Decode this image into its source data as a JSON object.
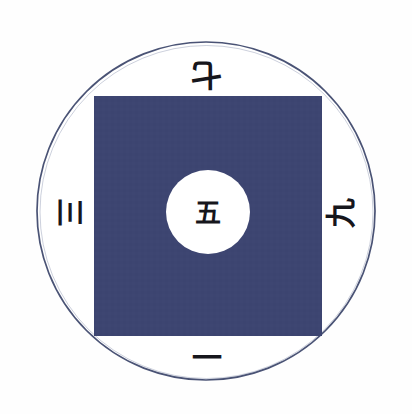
{
  "figure": {
    "background_color": "#fefefe"
  },
  "shapes": {
    "outer_circle": {
      "name": "outer-circle",
      "cx": 206,
      "cy": 211,
      "r": 169,
      "fill": "#ffffff",
      "stroke": "#4a5375",
      "stroke_width": 1.6
    },
    "square": {
      "name": "navy-square",
      "x": 94,
      "y": 96,
      "width": 228,
      "height": 240,
      "fill": "#3e4571"
    },
    "inner_circle": {
      "name": "inner-white-circle",
      "cx": 208,
      "cy": 212,
      "r": 42,
      "fill": "#ffffff"
    }
  },
  "labels": {
    "top": {
      "text": "七",
      "meaning": "seven",
      "rotation_deg": 180
    },
    "left": {
      "text": "三",
      "meaning": "three",
      "rotation_deg": 90
    },
    "right": {
      "text": "九",
      "meaning": "nine",
      "rotation_deg": -90
    },
    "bottom": {
      "text": "一",
      "meaning": "one",
      "rotation_deg": 0
    },
    "center": {
      "text": "五",
      "meaning": "five",
      "rotation_deg": 0
    }
  },
  "colors": {
    "navy": "#3e4571",
    "outline": "#4a5375",
    "ink": "#16161c",
    "paper": "#fefefe"
  }
}
